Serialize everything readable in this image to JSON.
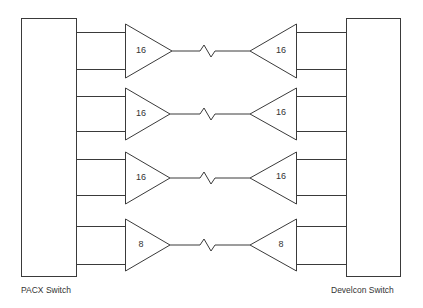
{
  "diagram": {
    "left_switch": {
      "label": "PACX Switch"
    },
    "right_switch": {
      "label": "Develcon Switch"
    },
    "links": [
      {
        "left_count": "16",
        "right_count": "16"
      },
      {
        "left_count": "16",
        "right_count": "16"
      },
      {
        "left_count": "16",
        "right_count": "16"
      },
      {
        "left_count": "8",
        "right_count": "8"
      }
    ]
  },
  "colors": {
    "stroke": "#3a3a3a",
    "background": "#ffffff"
  }
}
